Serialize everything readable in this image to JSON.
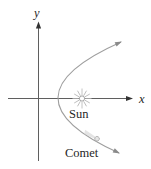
{
  "figure": {
    "axes": {
      "x_label": "x",
      "y_label": "y"
    },
    "labels": {
      "sun": "Sun",
      "comet": "Comet"
    },
    "icons": {
      "sun": "sun-starburst-icon",
      "comet": "comet-with-tail-icon",
      "axis_arrows": "arrowhead-icon",
      "trajectory_arrows": "arrowhead-icon"
    },
    "colors": {
      "background": "#ffffff",
      "axis": "#5f5f5f",
      "axis_arrow": "#333333",
      "curve": "#9e9e9e",
      "curve_arrow": "#8a8a8a",
      "text": "#1f1f1f",
      "sun_rays": "#b5b5b5",
      "sun_core_fill": "#ffffff",
      "sun_core_stroke": "#9a9a9a",
      "comet_fill": "#e6e6e6",
      "comet_stroke": "#ababab",
      "comet_tail": "#d6d6d6"
    }
  }
}
